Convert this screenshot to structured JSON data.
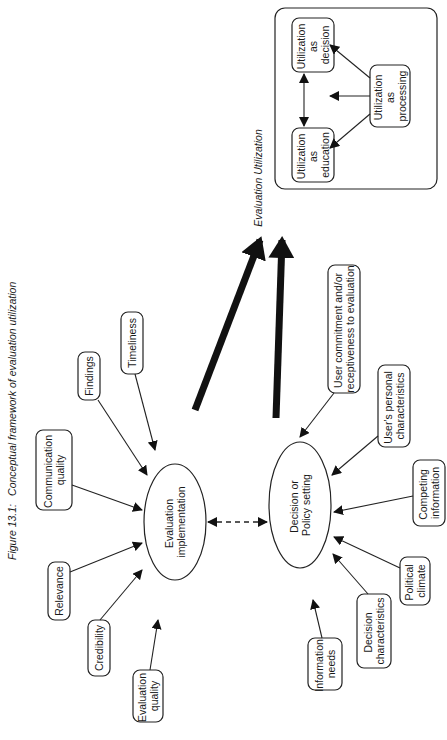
{
  "figure": {
    "caption_number": "Figure 13.1:",
    "caption_title": "Conceptual framework of evaluation utilization"
  },
  "utilization": {
    "title": "Evaluation Utilization",
    "decision": [
      "Utilization",
      "as",
      "decision"
    ],
    "education": [
      "Utilization",
      "as",
      "education"
    ],
    "processing": [
      "Utilization",
      "as",
      "processing"
    ]
  },
  "centers": {
    "evaluation": [
      "Evaluation",
      "implementation"
    ],
    "decision": [
      "Decision or",
      "Policy setting"
    ]
  },
  "evaluation_factors": [
    {
      "lines": [
        "Evaluation",
        "quality"
      ]
    },
    {
      "lines": [
        "Credibility"
      ]
    },
    {
      "lines": [
        "Relevance"
      ]
    },
    {
      "lines": [
        "Communication",
        "quality"
      ]
    },
    {
      "lines": [
        "Findings"
      ]
    },
    {
      "lines": [
        "Timeliness"
      ]
    }
  ],
  "decision_factors": [
    {
      "lines": [
        "Information",
        "needs"
      ]
    },
    {
      "lines": [
        "Decision",
        "characteristics"
      ]
    },
    {
      "lines": [
        "Political",
        "climate"
      ]
    },
    {
      "lines": [
        "Competing",
        "information"
      ]
    },
    {
      "lines": [
        "User's personal",
        "characteristics"
      ]
    },
    {
      "lines": [
        "User commitment and/or",
        "receptiveness to evaluation"
      ]
    }
  ]
}
